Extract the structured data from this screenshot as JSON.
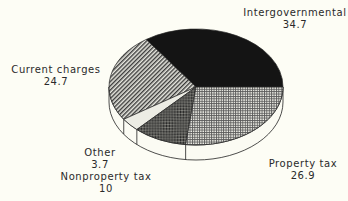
{
  "chart_data": {
    "type": "pie",
    "style": "3d",
    "title": "",
    "categories": [
      "Intergovernmental",
      "Property tax",
      "Nonproperty tax",
      "Other",
      "Current charges"
    ],
    "values": [
      34.7,
      26.9,
      10,
      3.7,
      24.7
    ],
    "labels": [
      {
        "name": "Intergovernmental",
        "value": "34.7"
      },
      {
        "name": "Property tax",
        "value": "26.9"
      },
      {
        "name": "Nonproperty tax",
        "value": "10"
      },
      {
        "name": "Other",
        "value": "3.7"
      },
      {
        "name": "Current charges",
        "value": "24.7"
      }
    ],
    "fills": {
      "Intergovernmental": "solid black",
      "Property tax": "fine grid dots",
      "Nonproperty tax": "dark crosshatch",
      "Other": "light/white",
      "Current charges": "diagonal hatch"
    },
    "legend": "none (direct labels)"
  },
  "colors": {
    "background": "#fdfdf5",
    "ink": "#111111"
  }
}
